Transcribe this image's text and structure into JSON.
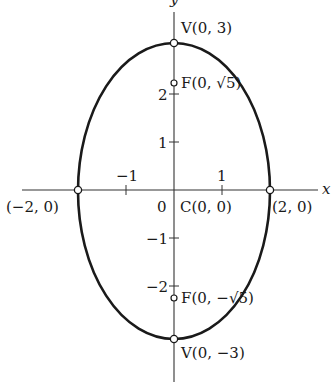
{
  "diagram": {
    "type": "ellipse-graph",
    "equation_hint": "x^2/4 + y^2/9 = 1",
    "center": {
      "x": 0,
      "y": 0
    },
    "semi_axes": {
      "a_horizontal": 2,
      "b_vertical": 3
    },
    "colors": {
      "curve": "#1a1a1a",
      "axis": "#333333",
      "background": "#ffffff"
    },
    "axes": {
      "x_label": "x",
      "y_label": "y",
      "x_ticks": [
        {
          "value": -1,
          "label": "−1"
        },
        {
          "value": 1,
          "label": "1"
        }
      ],
      "y_ticks": [
        {
          "value": 2,
          "label": "2"
        },
        {
          "value": 1,
          "label": "1"
        },
        {
          "value": -1,
          "label": "−1"
        },
        {
          "value": -2,
          "label": "−2"
        }
      ],
      "origin_label": "0"
    },
    "points": {
      "top_vertex": {
        "label": "V(0, 3)",
        "x": 0,
        "y": 3
      },
      "bottom_vertex": {
        "label": "V(0, −3)",
        "x": 0,
        "y": -3
      },
      "top_focus": {
        "label_prefix": "F(0, ",
        "label_radicand": "5",
        "label_suffix": ")",
        "x": 0,
        "y": 2.236
      },
      "bottom_focus": {
        "label_prefix": "F(0, −",
        "label_radicand": "5",
        "label_suffix": ")",
        "x": 0,
        "y": -2.236
      },
      "left_vertex": {
        "label": "(−2, 0)",
        "x": -2,
        "y": 0
      },
      "right_vertex": {
        "label": "(2, 0)",
        "x": 2,
        "y": 0
      },
      "center": {
        "label": "C(0, 0)",
        "x": 0,
        "y": 0
      }
    }
  }
}
